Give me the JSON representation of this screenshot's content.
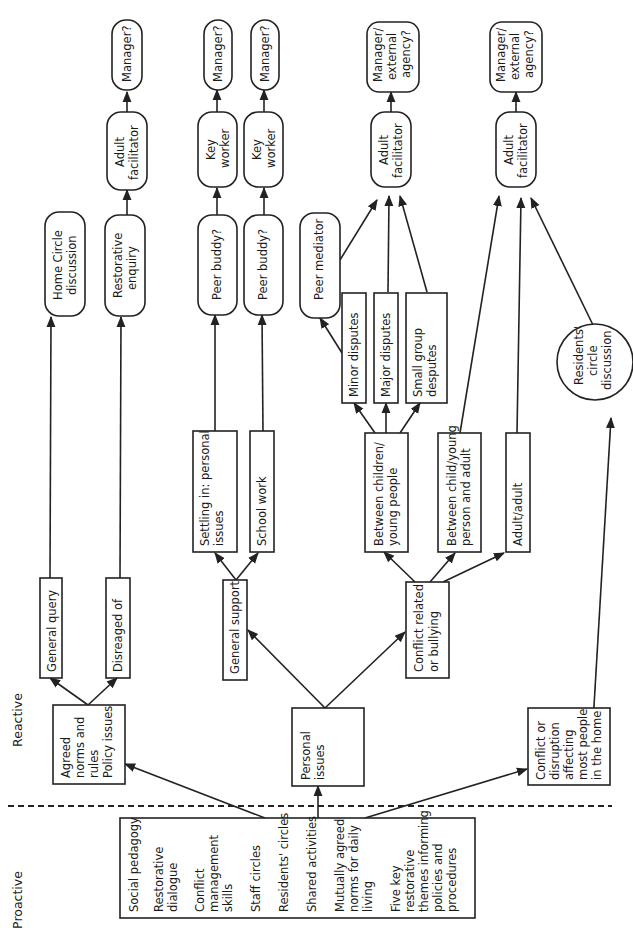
{
  "diagram": {
    "orientation": "rotated-90-ccw",
    "colors": {
      "stroke": "#222222",
      "background": "#ffffff",
      "text": "#1a1a1a"
    },
    "sections": {
      "proactive": "Proactive",
      "reactive": "Reactive"
    },
    "nodes": {
      "proactive_list": {
        "shape": "rect",
        "lines": [
          "Social pedagogy",
          "Restorative",
          "dialogue",
          "Conflict",
          "management",
          "skills",
          "Staff circles",
          "Residents' circles",
          "Shared activities",
          "Mutually agreed",
          "norms for daily",
          "living",
          "Five key",
          "restorative",
          "themes informing",
          "policies and",
          "procedures"
        ]
      },
      "agreed_norms": {
        "shape": "rect",
        "lines": [
          "Agreed",
          "norms and",
          "rules",
          "Policy issues"
        ]
      },
      "personal_issues": {
        "shape": "rect",
        "lines": [
          "Personal",
          "issues"
        ]
      },
      "conflict_home": {
        "shape": "rect",
        "lines": [
          "Conflict or",
          "disruption",
          "affecting",
          "most people",
          "in the home"
        ]
      },
      "general_query": {
        "shape": "rect",
        "lines": [
          "General query"
        ]
      },
      "disregard": {
        "shape": "rect",
        "lines": [
          "Disreaged of"
        ]
      },
      "general_support": {
        "shape": "rect",
        "lines": [
          "General support"
        ]
      },
      "conflict_bullying": {
        "shape": "rect",
        "lines": [
          "Conflict related",
          "or bullying"
        ]
      },
      "settling_in": {
        "shape": "rect",
        "lines": [
          "Settling in: personal",
          "issues"
        ]
      },
      "school_work": {
        "shape": "rect",
        "lines": [
          "School work"
        ]
      },
      "between_children": {
        "shape": "rect",
        "lines": [
          "Between children/",
          "young people"
        ]
      },
      "between_child_adult": {
        "shape": "rect",
        "lines": [
          "Between child/young",
          "person and adult"
        ]
      },
      "adult_adult": {
        "shape": "rect",
        "lines": [
          "Adult/adult"
        ]
      },
      "minor_disputes": {
        "shape": "rect",
        "lines": [
          "Minor disputes"
        ]
      },
      "major_disputes": {
        "shape": "rect",
        "lines": [
          "Major disputes"
        ]
      },
      "small_group": {
        "shape": "rect",
        "lines": [
          "Small group",
          "desputes"
        ]
      },
      "home_circle": {
        "shape": "rounded",
        "lines": [
          "Home Circle",
          "discussion"
        ]
      },
      "restorative_enquiry": {
        "shape": "rounded",
        "lines": [
          "Restorative",
          "enquiry"
        ]
      },
      "peer_buddy_1": {
        "shape": "rounded",
        "lines": [
          "Peer buddy?"
        ]
      },
      "peer_buddy_2": {
        "shape": "rounded",
        "lines": [
          "Peer buddy?"
        ]
      },
      "peer_mediator": {
        "shape": "rounded",
        "lines": [
          "Peer mediator"
        ]
      },
      "residents_circle": {
        "shape": "circle",
        "lines": [
          "Residents'",
          "circle",
          "discussion"
        ]
      },
      "adult_facilitator_1": {
        "shape": "rounded",
        "lines": [
          "Adult",
          "facilitator"
        ]
      },
      "key_worker_1": {
        "shape": "rounded",
        "lines": [
          "Key",
          "worker"
        ]
      },
      "key_worker_2": {
        "shape": "rounded",
        "lines": [
          "Key",
          "worker"
        ]
      },
      "adult_facilitator_2": {
        "shape": "rounded",
        "lines": [
          "Adult",
          "facilitator"
        ]
      },
      "adult_facilitator_3": {
        "shape": "rounded",
        "lines": [
          "Adult",
          "facilitator"
        ]
      },
      "manager_1": {
        "shape": "rounded",
        "lines": [
          "Manager?"
        ]
      },
      "manager_2": {
        "shape": "rounded",
        "lines": [
          "Manager?"
        ]
      },
      "manager_3": {
        "shape": "rounded",
        "lines": [
          "Manager?"
        ]
      },
      "manager_external_1": {
        "shape": "rounded",
        "lines": [
          "Manager/",
          "external",
          "agency?"
        ]
      },
      "manager_external_2": {
        "shape": "rounded",
        "lines": [
          "Manager/",
          "external",
          "agency?"
        ]
      }
    },
    "edges": [
      [
        "proactive_list",
        "agreed_norms"
      ],
      [
        "proactive_list",
        "personal_issues"
      ],
      [
        "proactive_list",
        "conflict_home"
      ],
      [
        "agreed_norms",
        "general_query"
      ],
      [
        "agreed_norms",
        "disregard"
      ],
      [
        "personal_issues",
        "general_support"
      ],
      [
        "personal_issues",
        "conflict_bullying"
      ],
      [
        "general_query",
        "home_circle"
      ],
      [
        "disregard",
        "restorative_enquiry"
      ],
      [
        "general_support",
        "settling_in"
      ],
      [
        "general_support",
        "school_work"
      ],
      [
        "settling_in",
        "peer_buddy_1"
      ],
      [
        "school_work",
        "peer_buddy_2"
      ],
      [
        "conflict_bullying",
        "between_children"
      ],
      [
        "conflict_bullying",
        "between_child_adult"
      ],
      [
        "conflict_bullying",
        "adult_adult"
      ],
      [
        "between_children",
        "minor_disputes"
      ],
      [
        "between_children",
        "major_disputes"
      ],
      [
        "between_children",
        "small_group"
      ],
      [
        "minor_disputes",
        "peer_mediator"
      ],
      [
        "peer_mediator",
        "adult_facilitator_2"
      ],
      [
        "major_disputes",
        "adult_facilitator_2"
      ],
      [
        "small_group",
        "adult_facilitator_2"
      ],
      [
        "between_child_adult",
        "adult_facilitator_3"
      ],
      [
        "adult_adult",
        "adult_facilitator_3"
      ],
      [
        "conflict_home",
        "residents_circle"
      ],
      [
        "residents_circle",
        "adult_facilitator_3"
      ],
      [
        "restorative_enquiry",
        "adult_facilitator_1"
      ],
      [
        "adult_facilitator_1",
        "manager_1"
      ],
      [
        "peer_buddy_1",
        "key_worker_1"
      ],
      [
        "key_worker_1",
        "manager_2"
      ],
      [
        "peer_buddy_2",
        "key_worker_2"
      ],
      [
        "key_worker_2",
        "manager_3"
      ],
      [
        "adult_facilitator_2",
        "manager_external_1"
      ],
      [
        "adult_facilitator_3",
        "manager_external_2"
      ]
    ]
  }
}
